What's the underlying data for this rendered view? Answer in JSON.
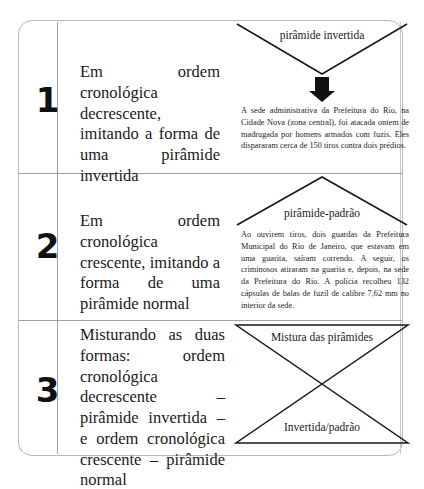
{
  "figure": {
    "type": "journalism-structure-table",
    "rows": [
      {
        "number": "1",
        "statement": "Em ordem cronológica decrescente, imitando a forma de uma pirâmide invertida",
        "diagram": {
          "shape": "inverted-pyramid",
          "label": "pirâmide invertida",
          "arrow": "down-arrow"
        },
        "body": "A sede administrativa da Prefeitura do Rio, na Cidade Nova (zona central), foi atacada ontem de madrugada por homens armados com fuzis. Eles dispararam cerca de 150 tiros contra dois prédios."
      },
      {
        "number": "2",
        "statement": "Em ordem cronológica crescente, imitando a forma de uma pirâmide normal",
        "diagram": {
          "shape": "standard-pyramid",
          "label": "pirâmide-padrão"
        },
        "body": "Ao ouvirem tiros, dois guardas da Prefeitura Municipal do Rio de Janeiro, que estavam em uma guarita, saíram correndo. A seguir, os criminosos atiraram na guarita e, depois, na sede da Prefeitura do Rio. A polícia recolheu 132 cápsulas de balas de fuzil de calibre 7,62 mm no interior da sede."
      },
      {
        "number": "3",
        "statement": "Misturando as duas formas: ordem cronológica decrescente – pirâmide invertida – e ordem cronológica crescente – pirâmide normal",
        "diagram": {
          "shape": "mixed-pyramids-hourglass",
          "label_top": "Mistura das pirâmides",
          "label_bottom": "Invertida/padrão"
        },
        "body": ""
      }
    ]
  },
  "colors": {
    "ink": "#1a1a1a",
    "rule": "#9f9f9f",
    "frame_border": "#b9b9b9",
    "shadow": "#9c9c9c",
    "background": "#ffffff"
  }
}
